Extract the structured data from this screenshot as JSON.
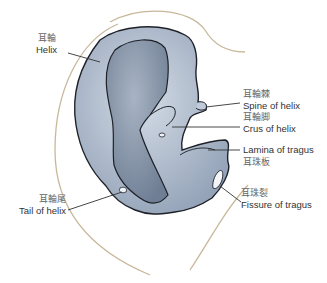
{
  "figure": {
    "colors": {
      "cartilage_light": "#b7c3d3",
      "cartilage_dark": "#7f8ea3",
      "outline": "#1e2128",
      "skin_outline": "#c8b89a",
      "leader_line": "#333333"
    }
  },
  "labels": [
    {
      "id": "helix",
      "cn": "耳輪",
      "en": "Helix"
    },
    {
      "id": "spine_of_helix",
      "cn": "耳輪棘",
      "en": "Spine of helix"
    },
    {
      "id": "crus_of_helix",
      "cn": "耳輪脚",
      "en": "Crus of helix"
    },
    {
      "id": "lamina_of_tragus",
      "cn": "耳珠板",
      "en": "Lamina of tragus"
    },
    {
      "id": "fissure_of_tragus",
      "cn": "耳珠裂",
      "en": "Fissure of tragus"
    },
    {
      "id": "tail_of_helix",
      "cn": "耳輪尾",
      "en": "Tail of helix"
    }
  ]
}
